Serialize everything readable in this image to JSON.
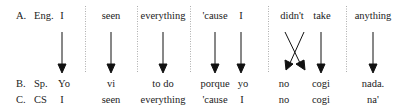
{
  "rows": {
    "A": {
      "label": "A.",
      "lang": "Eng.",
      "words": [
        "I",
        "seen",
        "everything",
        "'cause",
        "I",
        "didn't",
        "take",
        "anything"
      ]
    },
    "B": {
      "label": "B.",
      "lang": "Sp.",
      "words": [
        "Yo",
        "vi",
        "to do",
        "porque",
        "yo",
        "no",
        "cogi",
        "nada."
      ]
    },
    "C": {
      "label": "C.",
      "lang": "CS",
      "words": [
        "I",
        "seen",
        "everything",
        "'cause",
        "I",
        "no",
        "cogi",
        "na'"
      ]
    }
  },
  "arrows": [
    {
      "from": "I",
      "to": "Yo",
      "type": "straight"
    },
    {
      "from": "seen",
      "to": "vi",
      "type": "straight"
    },
    {
      "from": "everything",
      "to": "to do",
      "type": "straight"
    },
    {
      "from": "'cause",
      "to": "porque",
      "type": "straight"
    },
    {
      "from": "I",
      "to": "yo",
      "type": "straight"
    },
    {
      "from": "didn't",
      "to": "no",
      "type": "crossed"
    },
    {
      "from": "take",
      "to": "cogi",
      "type": "straight"
    },
    {
      "from": "anything",
      "to": "nada.",
      "type": "straight"
    }
  ],
  "separators": 5
}
